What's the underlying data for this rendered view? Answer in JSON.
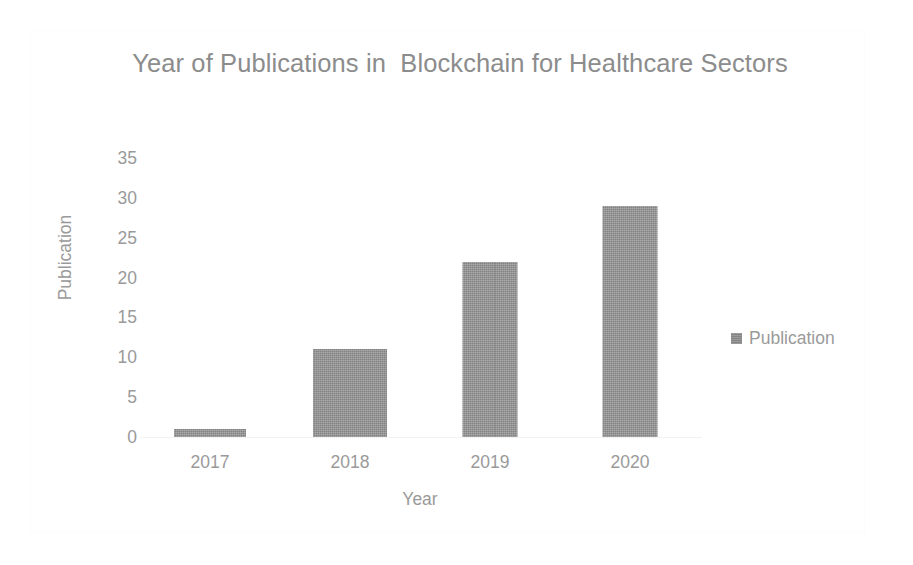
{
  "chart_data": {
    "type": "bar",
    "title": "Year of Publications in  Blockchain for Healthcare Sectors",
    "title_line1": "Year of Publications in  Blockchain for Healthcare",
    "title_line2": "Sectors",
    "xlabel": "Year",
    "ylabel": "Publication",
    "categories": [
      "2017",
      "2018",
      "2019",
      "2020"
    ],
    "values": [
      1,
      11,
      22,
      29
    ],
    "series": [
      {
        "name": "Publication",
        "values": [
          1,
          11,
          22,
          29
        ]
      }
    ],
    "ylim": [
      0,
      35
    ],
    "y_ticks": [
      "0",
      "5",
      "10",
      "15",
      "20",
      "25",
      "30",
      "35"
    ],
    "y_tick_values": [
      0,
      5,
      10,
      15,
      20,
      25,
      30,
      35
    ],
    "grid": false,
    "legend": {
      "position": "right",
      "entries": [
        {
          "label": "Publication",
          "color": "#969696"
        }
      ]
    },
    "colors": {
      "bar_fill": "#969696",
      "text": "#9a9a9a",
      "title_text": "#8c8c8c",
      "background": "#ffffff",
      "axis_line": "#f2f2f2",
      "frame_border": "#fcfcfc"
    }
  }
}
